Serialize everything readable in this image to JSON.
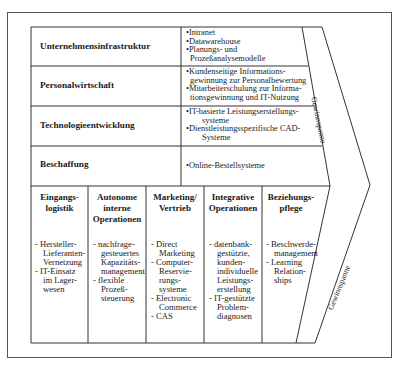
{
  "support_activities": [
    {
      "label": "Unternehmensinfrastruktur",
      "items": [
        "•Intranet",
        "•Datawarehouse",
        "•Planungs- und",
        "Prozeßanalysemodelle"
      ]
    },
    {
      "label": "Personalwirtschaft",
      "items": [
        "•Kundenseitige Informations-",
        "gewinnung zur Personalbewertung",
        "•Mitarbeiterschulung zur Informa-",
        "tionsgewinnung und IT-Nutzung"
      ]
    },
    {
      "label": "Technologieentwicklung",
      "items": [
        "•IT-basierte Leistungserstellungs-",
        "systeme",
        "•Dienstleistungsspezifische CAD-",
        "Systeme"
      ]
    },
    {
      "label": "Beschaffung",
      "items": [
        "•Online-Bestellsysteme"
      ]
    }
  ],
  "primary_activities": [
    {
      "header": [
        "Eingangs-",
        "logistik"
      ],
      "items": [
        "- Hersteller-",
        "Lieferanten-",
        "Vernetzung",
        "- IT-Einsatz",
        "im Lager-",
        "wesen"
      ]
    },
    {
      "header": [
        "Autonome",
        "interne",
        "Operationen"
      ],
      "items": [
        "- nachfrage-",
        "gesteuertes",
        "Kapazitäts-",
        "management",
        "- flexible",
        "Prozeß-",
        "steuerung"
      ]
    },
    {
      "header": [
        "Marketing/",
        "Vertrieb"
      ],
      "items": [
        "- Direct",
        "Marketing",
        "- Computer-",
        "Reservie-",
        "rungs-",
        "systeme",
        "- Electronic",
        "Commerce",
        "- CAS"
      ]
    },
    {
      "header": [
        "Integrative",
        "Operationen"
      ],
      "items": [
        "- datenbank-",
        "gestützte,",
        "kunden-",
        "individuelle",
        "Leistungs-",
        "erstellung",
        "- IT-gestützte",
        "Problem-",
        "diagnosen"
      ]
    },
    {
      "header": [
        "Beziehungs-",
        "pflege"
      ],
      "items": [
        "- Beschwerde-",
        "management",
        "- Learning",
        "Relation-",
        "ships"
      ]
    }
  ],
  "margin_label_top": "Gewinnspanne",
  "margin_label_bottom": "Gewinnspanne"
}
